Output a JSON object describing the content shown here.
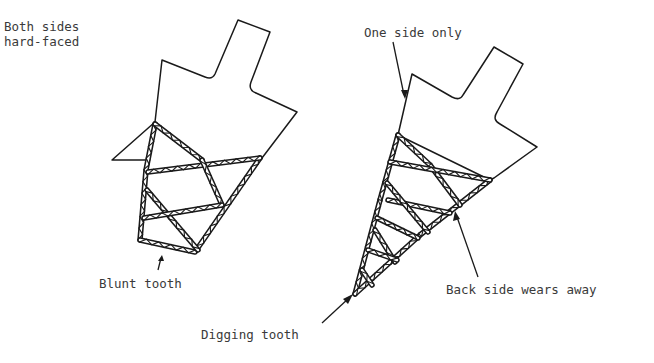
{
  "diagram": {
    "figures": [
      {
        "id": "left-tooth",
        "caption_top": "Both sides\nhard-faced",
        "caption_bottom": "Blunt tooth"
      },
      {
        "id": "right-tooth",
        "caption_top": "One side only",
        "caption_side": "Back side wears away",
        "caption_bottom": "Digging tooth"
      }
    ]
  },
  "labels": {
    "both_sides": "Both sides\nhard-faced",
    "one_side": "One side only",
    "blunt": "Blunt tooth",
    "back_side": "Back side wears away",
    "digging": "Digging tooth"
  },
  "colors": {
    "ink": "#1a1a1a",
    "text": "#3a3a3a",
    "background": "#ffffff"
  }
}
